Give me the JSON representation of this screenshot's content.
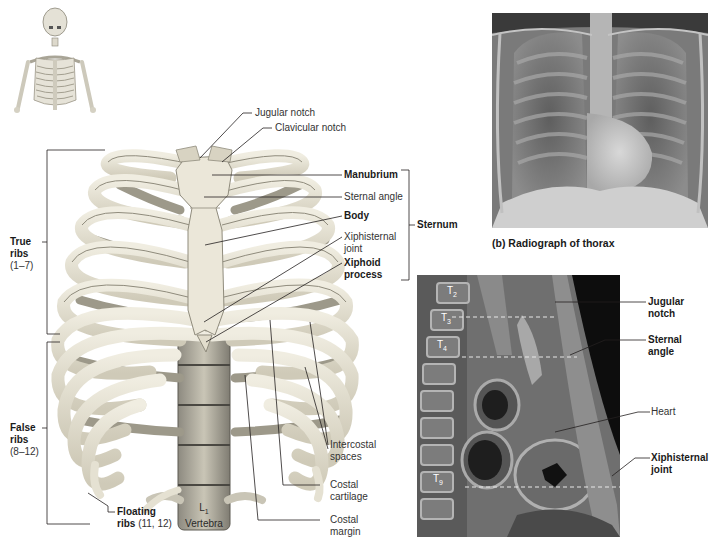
{
  "figure": {
    "panel_a": {
      "name": "Thoracic cage anterior view",
      "labels": {
        "jugular_notch": "Jugular notch",
        "clavicular_notch": "Clavicular notch",
        "manubrium": "Manubrium",
        "sternal_angle": "Sternal angle",
        "body": "Body",
        "xiphisternal_joint_line1": "Xiphisternal",
        "xiphisternal_joint_line2": "joint",
        "xiphoid_line1": "Xiphoid",
        "xiphoid_line2": "process",
        "sternum": "Sternum",
        "true_ribs_line1": "True",
        "true_ribs_line2": "ribs",
        "true_ribs_range": "(1–7)",
        "false_ribs_line1": "False",
        "false_ribs_line2": "ribs",
        "false_ribs_range": "(8–12)",
        "floating_ribs_line1": "Floating",
        "floating_ribs_line2": "ribs",
        "floating_ribs_range": "(11, 12)",
        "vertebra_label": "L",
        "vertebra_sub": "1",
        "vertebra_word": "Vertebra",
        "intercostal_line1": "Intercostal",
        "intercostal_line2": "spaces",
        "costal_cartilage_line1": "Costal",
        "costal_cartilage_line2": "cartilage",
        "costal_margin_line1": "Costal",
        "costal_margin_line2": "margin"
      }
    },
    "panel_b": {
      "caption": "(b) Radiograph of thorax"
    },
    "panel_c": {
      "vertebrae": [
        {
          "label": "T",
          "sub": "2"
        },
        {
          "label": "T",
          "sub": "3"
        },
        {
          "label": "T",
          "sub": "4"
        },
        {
          "label": "T",
          "sub": "9"
        }
      ],
      "labels": {
        "jugular_notch_line1": "Jugular",
        "jugular_notch_line2": "notch",
        "sternal_angle_line1": "Sternal",
        "sternal_angle_line2": "angle",
        "heart": "Heart",
        "xiphisternal_line1": "Xiphisternal",
        "xiphisternal_line2": "joint"
      }
    },
    "colors": {
      "bone": "#e8e4d4",
      "bone_shadow": "#b9b4a3",
      "leader_line": "#231f20",
      "dashed_line": "#e0e0e0"
    }
  }
}
